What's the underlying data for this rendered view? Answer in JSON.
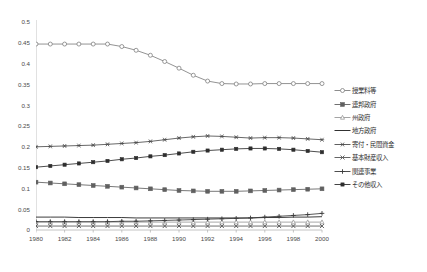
{
  "chart_data": {
    "type": "line",
    "title": "",
    "subtitle": "",
    "xlabel": "",
    "ylabel": "",
    "x": [
      1980,
      1981,
      1982,
      1983,
      1984,
      1985,
      1986,
      1987,
      1988,
      1989,
      1990,
      1991,
      1992,
      1993,
      1994,
      1995,
      1996,
      1997,
      1998,
      1999,
      2000
    ],
    "xlim": [
      1980,
      2000
    ],
    "ylim": [
      0,
      0.5
    ],
    "xticks": [
      "1980",
      "1982",
      "1984",
      "1986",
      "1988",
      "1990",
      "1992",
      "1994",
      "1996",
      "1998",
      "2000"
    ],
    "yticks": [
      "0",
      "0.05",
      "0.1",
      "0.15",
      "0.2",
      "0.25",
      "0.3",
      "0.35",
      "0.4",
      "0.45",
      "0.5"
    ],
    "grid": false,
    "legend_position": "right",
    "series": [
      {
        "name": "授業料等",
        "marker": "circle-open",
        "color": "#808080",
        "values": [
          0.447,
          0.447,
          0.447,
          0.447,
          0.447,
          0.447,
          0.441,
          0.432,
          0.42,
          0.405,
          0.389,
          0.372,
          0.358,
          0.352,
          0.351,
          0.351,
          0.352,
          0.352,
          0.352,
          0.352,
          0.352
        ]
      },
      {
        "name": "連邦政府",
        "marker": "square-filled",
        "color": "#606060",
        "values": [
          0.115,
          0.113,
          0.111,
          0.109,
          0.107,
          0.105,
          0.103,
          0.101,
          0.099,
          0.097,
          0.095,
          0.094,
          0.093,
          0.093,
          0.093,
          0.094,
          0.095,
          0.096,
          0.097,
          0.098,
          0.099
        ]
      },
      {
        "name": "州政府",
        "marker": "triangle-open",
        "color": "#9a9a9a",
        "values": [
          0.019,
          0.019,
          0.019,
          0.019,
          0.019,
          0.019,
          0.019,
          0.019,
          0.019,
          0.019,
          0.019,
          0.019,
          0.019,
          0.019,
          0.019,
          0.019,
          0.019,
          0.019,
          0.019,
          0.019,
          0.019
        ]
      },
      {
        "name": "地方政府",
        "marker": "none",
        "color": "#1a1a1a",
        "values": [
          0.031,
          0.031,
          0.031,
          0.03,
          0.03,
          0.03,
          0.03,
          0.029,
          0.029,
          0.029,
          0.029,
          0.029,
          0.029,
          0.029,
          0.029,
          0.029,
          0.03,
          0.03,
          0.031,
          0.031,
          0.032
        ]
      },
      {
        "name": "寄付・民間資金",
        "marker": "asterisk",
        "color": "#4d4d4d",
        "values": [
          0.2,
          0.201,
          0.202,
          0.203,
          0.204,
          0.206,
          0.208,
          0.21,
          0.213,
          0.217,
          0.221,
          0.224,
          0.226,
          0.225,
          0.223,
          0.221,
          0.222,
          0.222,
          0.221,
          0.219,
          0.217
        ]
      },
      {
        "name": "基本財産収入",
        "marker": "x-mark",
        "color": "#555555",
        "values": [
          0.0095,
          0.0095,
          0.0095,
          0.0095,
          0.0095,
          0.0095,
          0.0095,
          0.0095,
          0.0095,
          0.0095,
          0.0095,
          0.0095,
          0.0095,
          0.0095,
          0.0095,
          0.0095,
          0.0095,
          0.0095,
          0.0095,
          0.0095,
          0.0095
        ]
      },
      {
        "name": "関連事業",
        "marker": "plus",
        "color": "#3a3a3a",
        "values": [
          0.02,
          0.02,
          0.02,
          0.02,
          0.02,
          0.02,
          0.021,
          0.021,
          0.022,
          0.023,
          0.024,
          0.025,
          0.026,
          0.027,
          0.028,
          0.029,
          0.031,
          0.033,
          0.035,
          0.037,
          0.04
        ]
      },
      {
        "name": "その他収入",
        "marker": "square-small",
        "color": "#2e2e2e",
        "values": [
          0.151,
          0.154,
          0.157,
          0.16,
          0.163,
          0.166,
          0.17,
          0.173,
          0.177,
          0.18,
          0.184,
          0.188,
          0.191,
          0.193,
          0.195,
          0.196,
          0.196,
          0.195,
          0.193,
          0.19,
          0.187
        ]
      }
    ]
  }
}
